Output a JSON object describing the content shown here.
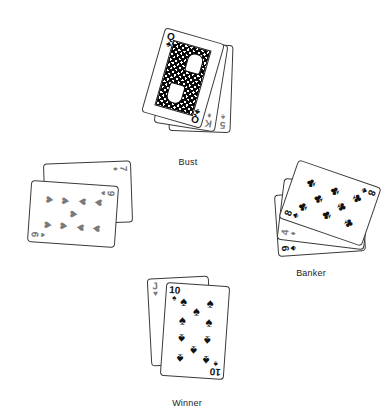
{
  "hands": [
    {
      "id": "bust",
      "label": "Bust",
      "cards": [
        {
          "rank": "5",
          "suit": "♠",
          "suit_name": "spades",
          "color": "#7a7a7a"
        },
        {
          "rank": "K",
          "suit": "♦",
          "suit_name": "diamonds",
          "color": "#7a7a7a"
        },
        {
          "rank": "Q",
          "suit": "♣",
          "suit_name": "clubs",
          "color": "#111111"
        }
      ]
    },
    {
      "id": "left",
      "label": "",
      "cards": [
        {
          "rank": "7",
          "suit": "♦",
          "suit_name": "diamonds",
          "color": "#7a7a7a"
        },
        {
          "rank": "9",
          "suit": "♥",
          "suit_name": "hearts",
          "color": "#7a7a7a"
        }
      ]
    },
    {
      "id": "banker",
      "label": "Banker",
      "cards": [
        {
          "rank": "9",
          "suit": "♣",
          "suit_name": "clubs",
          "color": "#111111"
        },
        {
          "rank": "4",
          "suit": "♦",
          "suit_name": "diamonds",
          "color": "#7a7a7a"
        },
        {
          "rank": "8",
          "suit": "♣",
          "suit_name": "clubs",
          "color": "#111111"
        }
      ]
    },
    {
      "id": "winner",
      "label": "Winner",
      "cards": [
        {
          "rank": "J",
          "suit": "♥",
          "suit_name": "hearts",
          "color": "#7a7a7a"
        },
        {
          "rank": "10",
          "suit": "♠",
          "suit_name": "spades",
          "color": "#111111"
        }
      ]
    }
  ]
}
